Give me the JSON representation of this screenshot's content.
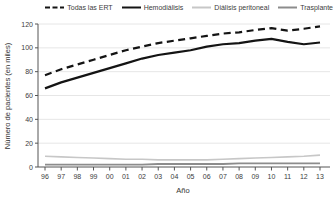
{
  "figure": {
    "background": "#ffffff",
    "text_color": "#3c3c3c",
    "grid_color": "#e3e3e3",
    "axis_color": "#555555"
  },
  "chart_data": {
    "type": "line",
    "title": "",
    "xlabel": "Año",
    "ylabel": "Número de pacientes (en miles)",
    "x_tick_labels": [
      "96",
      "97",
      "98",
      "99",
      "00",
      "01",
      "02",
      "03",
      "04",
      "05",
      "06",
      "07",
      "08",
      "09",
      "10",
      "11",
      "12",
      "13"
    ],
    "ylim": [
      0,
      120
    ],
    "y_ticks": [
      0,
      20,
      40,
      60,
      80,
      100,
      120
    ],
    "grid": "horizontal",
    "legend_position": "top-right",
    "series": [
      {
        "name": "Todas las ERT",
        "color": "#141414",
        "dash": "dashed",
        "width": 2.2,
        "values": [
          77,
          82,
          86,
          90,
          94,
          98,
          101,
          104,
          106,
          108,
          110,
          112,
          113,
          115,
          116.5,
          114.5,
          116,
          118
        ]
      },
      {
        "name": "Hemodiálisis",
        "color": "#141414",
        "dash": "solid",
        "width": 2.2,
        "values": [
          66,
          71,
          75,
          79,
          83,
          87,
          91,
          94,
          96,
          98,
          101,
          103,
          104,
          106,
          107.5,
          105,
          103,
          104.5
        ]
      },
      {
        "name": "Diálisis peritoneal",
        "color": "#c7c7c7",
        "dash": "solid",
        "width": 1.6,
        "values": [
          9,
          8.5,
          8,
          7.5,
          7,
          6.5,
          6.5,
          6,
          6,
          6,
          6,
          6.5,
          7,
          7.5,
          8,
          8.5,
          9,
          10
        ]
      },
      {
        "name": "Trasplante",
        "color": "#8c8c8c",
        "dash": "solid",
        "width": 1.8,
        "values": [
          2,
          2,
          2,
          2,
          2,
          2,
          2,
          2.5,
          2.5,
          2.5,
          2.5,
          2.5,
          3,
          3,
          3,
          3,
          3,
          3
        ]
      }
    ]
  }
}
